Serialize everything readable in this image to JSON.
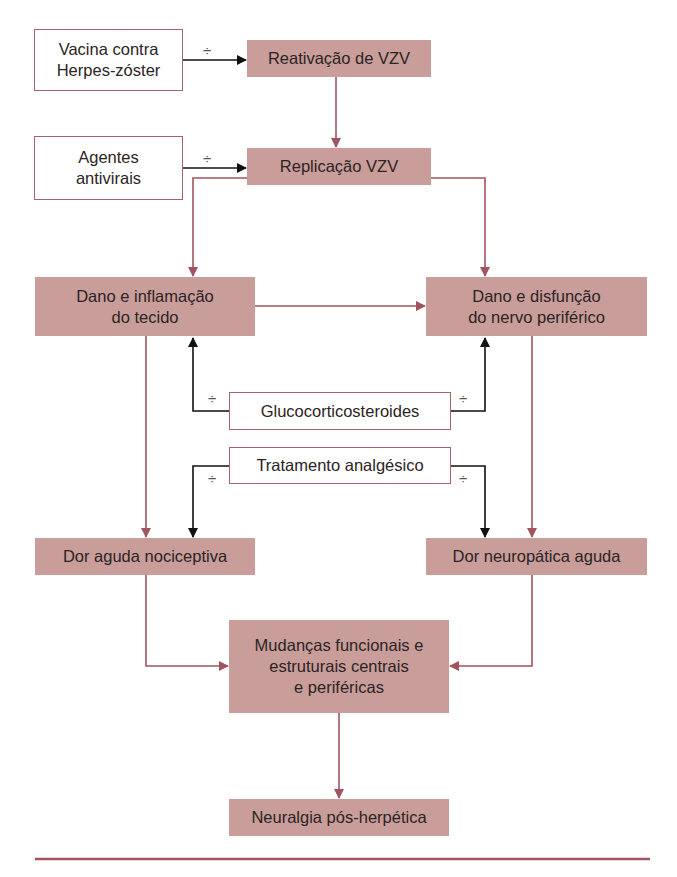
{
  "colors": {
    "box_fill": "#c99d9a",
    "connector": "#a3535f",
    "inhibitor": "#111111",
    "outline": "#a7636c"
  },
  "inhibitor_symbol": "÷",
  "nodes": {
    "vaccine": "Vacina contra\nHerpes-zóster",
    "antivirals": "Agentes\nantivirais",
    "reactivation": "Reativação de VZV",
    "replication": "Replicação VZV",
    "tissue_damage": "Dano e inflamação\ndo tecido",
    "nerve_damage": "Dano e disfunção\ndo nervo periférico",
    "glucocorticoids": "Glucocorticosteroides",
    "analgesic": "Tratamento analgésico",
    "nociceptive_pain": "Dor aguda nociceptiva",
    "neuropathic_pain": "Dor neuropática aguda",
    "central_changes": "Mudanças funcionais e\nestruturais centrais\ne periféricas",
    "phn": "Neuralgia pós-herpética"
  }
}
